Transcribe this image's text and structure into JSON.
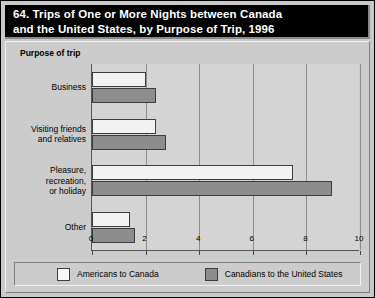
{
  "title": "64. Trips of One or More Nights between Canada\n      and the United States, by Purpose of Trip, 1996",
  "group_axis_label": "Purpose of trip",
  "legend": {
    "entries": [
      {
        "label": "Americans to Canada",
        "swatch": "light",
        "color": "#f7f7f7"
      },
      {
        "label": "Canadians to the United States",
        "swatch": "dark",
        "color": "#8d8d8d"
      }
    ]
  },
  "chart_data": {
    "type": "bar",
    "orientation": "horizontal",
    "title": "64. Trips of One or More Nights between Canada and the United States, by Purpose of Trip, 1996",
    "xlabel": "Millions of person-trips",
    "ylabel": "Purpose of trip",
    "xlim": [
      0,
      10
    ],
    "xticks": [
      0,
      2,
      4,
      6,
      8,
      10
    ],
    "xtick_labels": [
      "0",
      "2",
      "4",
      "6",
      "8",
      "10"
    ],
    "grid": true,
    "grid_axis": "x",
    "legend_position": "bottom",
    "categories": [
      "Business",
      "Visiting friends\nand relatives",
      "Pleasure,\nrecreation,\nor holiday",
      "Other"
    ],
    "series": [
      {
        "name": "Americans to Canada",
        "color": "#f2f2f2",
        "values": [
          2.0,
          2.4,
          7.5,
          1.4
        ]
      },
      {
        "name": "Canadians to the United States",
        "color": "#8d8d8d",
        "values": [
          2.4,
          2.75,
          8.95,
          1.6
        ]
      }
    ]
  }
}
